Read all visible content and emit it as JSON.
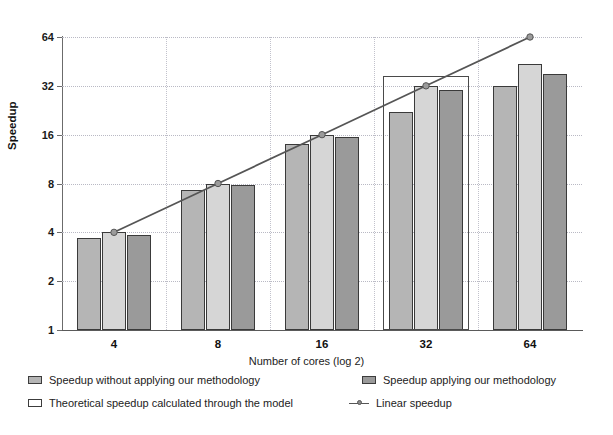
{
  "chart_data": {
    "type": "bar",
    "title": "",
    "xlabel": "Number of cores (log 2)",
    "ylabel": "Speedup",
    "categories": [
      "4",
      "8",
      "16",
      "32",
      "64"
    ],
    "ytick_labels": [
      "1",
      "2",
      "4",
      "8",
      "16",
      "32",
      "64"
    ],
    "ytick_values": [
      1,
      2,
      4,
      8,
      16,
      32,
      64
    ],
    "ylim": [
      1,
      64
    ],
    "yscale": "log2",
    "grid": true,
    "legend_position": "bottom",
    "series": [
      {
        "name": "Speedup without applying our methodology",
        "type": "bar",
        "color": "#b5b5b5",
        "values": [
          3.7,
          7.3,
          14.1,
          22.0,
          31.8
        ]
      },
      {
        "name": "Theoretical speedup calculated through the model",
        "type": "bar",
        "color": "#d6d6d6",
        "values": [
          4.0,
          8.0,
          16.0,
          32.0,
          43.5
        ]
      },
      {
        "name": "Speedup applying our methodology",
        "type": "bar",
        "color": "#9a9a9a",
        "values": [
          3.85,
          7.8,
          15.4,
          30.3,
          38.0
        ]
      },
      {
        "name": "Linear speedup",
        "type": "line",
        "color": "#555555",
        "values": [
          4,
          8,
          16,
          32,
          64
        ]
      }
    ],
    "annotations": [
      {
        "name": "highlight-box",
        "target_category": "32",
        "description": "rectangle outline around the 32-core bar group"
      }
    ]
  },
  "axes": {
    "y_title": "Speedup",
    "x_title": "Number of cores (log 2)"
  },
  "legend": {
    "items": [
      {
        "label": "Speedup without applying our methodology",
        "swatch": "series1-swatch"
      },
      {
        "label": "Speedup applying our methodology",
        "swatch": "series3-swatch"
      },
      {
        "label": "Theoretical  speedup  calculated through the model",
        "swatch": "theoretical-swatch"
      },
      {
        "label": "Linear speedup",
        "swatch": "line-marker"
      }
    ]
  },
  "colors": {
    "series1": "#b5b5b5",
    "series2": "#d6d6d6",
    "series3": "#9a9a9a",
    "line": "#555555",
    "grid": "#b9b9c4",
    "axis": "#6b6b6b"
  }
}
